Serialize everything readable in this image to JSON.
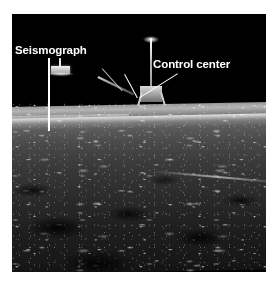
{
  "figure": {
    "kind": "annotated-photograph",
    "scene": {
      "sky_color": "#000000",
      "ground_highlight_color": "#b4b4b4",
      "label_color": "#ffffff",
      "page_background": "#ffffff"
    },
    "photo": {
      "x": 12,
      "y": 14,
      "width": 254,
      "height": 258,
      "horizon_y": 105
    }
  },
  "annotations": [
    {
      "id": "seismograph",
      "label": "Seismograph",
      "label_x": 15,
      "label_y": 44,
      "leader": {
        "x1": 50,
        "y1": 58,
        "x2": 50,
        "y2": 131
      },
      "target": {
        "x": 50,
        "y": 131
      }
    },
    {
      "id": "control-center",
      "label": "Control center",
      "label_x": 153,
      "label_y": 58,
      "leader_1": {
        "x1": 125,
        "y1": 74,
        "x2": 138,
        "y2": 98
      },
      "leader_2": {
        "x1": 178,
        "y1": 74,
        "x2": 140,
        "y2": 98
      },
      "target": {
        "x": 139,
        "y": 98
      }
    }
  ],
  "hardware": [
    {
      "id": "seismograph-unit",
      "name": "Seismograph experiment package"
    },
    {
      "id": "control-center-unit",
      "name": "Central station / control center with antenna"
    },
    {
      "id": "lem-strut",
      "name": "Support strut assembly"
    }
  ]
}
